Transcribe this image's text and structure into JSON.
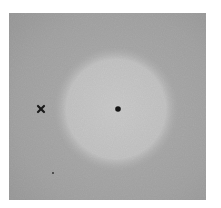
{
  "image": {
    "description": "Grayscale photograph of a mottled gray field with a large lighter circular zone in the center",
    "colors": {
      "background_dark": "#9e9e9e",
      "background_mid": "#adadad",
      "zone_light": "#cfcfcf",
      "zone_center": "#d6d6d6",
      "page": "#ffffff",
      "marker": "#1a1a1a"
    },
    "markers": [
      {
        "type": "cross",
        "label": "x",
        "x": 41,
        "y": 109
      },
      {
        "type": "dot",
        "x": 118,
        "y": 109
      },
      {
        "type": "speck",
        "x": 53,
        "y": 173
      }
    ],
    "zone": {
      "cx": 116,
      "cy": 109,
      "r": 56
    }
  }
}
